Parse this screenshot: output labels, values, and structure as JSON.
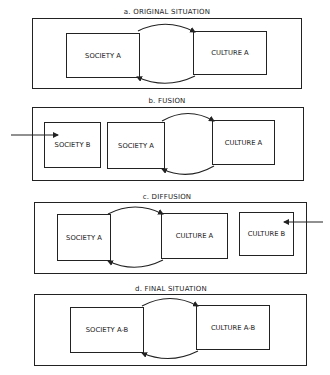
{
  "panels": [
    {
      "id": "a",
      "title": "a. ORIGINAL SITUATION",
      "boxes": [
        "SOCIETY A",
        "CULTURE A"
      ]
    },
    {
      "id": "b",
      "title": "b. FUSION",
      "boxes": [
        "SOCIETY B",
        "SOCIETY A",
        "CULTURE A"
      ],
      "external_arrow": {
        "direction": "right",
        "target": "SOCIETY B"
      }
    },
    {
      "id": "c",
      "title": "c. DIFFUSION",
      "boxes": [
        "SOCIETY A",
        "CULTURE A",
        "CULTURE B"
      ],
      "external_arrow": {
        "direction": "left",
        "target": "CULTURE B"
      }
    },
    {
      "id": "d",
      "title": "d. FINAL SITUATION",
      "boxes": [
        "SOCIETY A-B",
        "CULTURE A-B"
      ]
    }
  ],
  "colors": {
    "line": "#222222",
    "background": "#ffffff"
  }
}
